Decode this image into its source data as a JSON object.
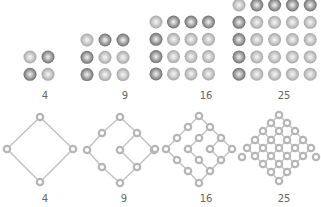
{
  "colors": {
    "sphere_dark_edge": "#6e6e6e",
    "sphere_dark_mid": "#9a9a9a",
    "sphere_light_edge": "#a9a9a9",
    "sphere_light_mid": "#cfcfcf",
    "sphere_highlight": "#f4f4f4",
    "edge": "#bdbdbd",
    "node": "#b5b5b5",
    "label": "#666666"
  },
  "sphere_grids": [
    {
      "label": "4",
      "label_x": 45,
      "label_y": 99,
      "x0": 30,
      "y0": 57,
      "step_x": 18,
      "step_y": 17.3,
      "r": 6.5,
      "pattern": [
        "LD",
        "DL"
      ]
    },
    {
      "label": "9",
      "label_x": 125,
      "label_y": 99,
      "x0": 87,
      "y0": 40,
      "step_x": 18,
      "step_y": 17.3,
      "r": 6.5,
      "pattern": [
        "LDD",
        "DLL",
        "DLL"
      ]
    },
    {
      "label": "16",
      "label_x": 206,
      "label_y": 99,
      "x0": 156,
      "y0": 22,
      "step_x": 17.5,
      "step_y": 17.3,
      "r": 6.5,
      "pattern": [
        "LDDD",
        "DLLL",
        "DLLL",
        "DLLL"
      ]
    },
    {
      "label": "25",
      "label_x": 284,
      "label_y": 99,
      "x0": 239,
      "y0": 5,
      "step_x": 17.8,
      "step_y": 17.3,
      "r": 6.5,
      "pattern": [
        "LDDDD",
        "DLLLL",
        "DLLLL",
        "DLLLL",
        "DLLLL"
      ]
    }
  ],
  "lattices": [
    {
      "label": "4",
      "label_x": 45,
      "label_y": 202,
      "nodes": [
        [
          40,
          117
        ],
        [
          7,
          149
        ],
        [
          73,
          149
        ],
        [
          40,
          182
        ]
      ],
      "edges": [
        [
          0,
          1
        ],
        [
          0,
          2
        ],
        [
          1,
          3
        ],
        [
          2,
          3
        ]
      ]
    },
    {
      "label": "9",
      "label_x": 124,
      "label_y": 202,
      "nodes": [
        [
          120,
          117
        ],
        [
          102,
          133
        ],
        [
          137,
          133
        ],
        [
          87,
          150
        ],
        [
          120,
          150
        ],
        [
          154,
          150
        ],
        [
          102,
          167
        ],
        [
          137,
          167
        ],
        [
          120,
          183
        ]
      ],
      "edges": [
        [
          0,
          1
        ],
        [
          0,
          2
        ],
        [
          1,
          3
        ],
        [
          3,
          6
        ],
        [
          6,
          8
        ],
        [
          2,
          4
        ],
        [
          2,
          5
        ],
        [
          4,
          7
        ],
        [
          5,
          7
        ],
        [
          7,
          8
        ]
      ]
    },
    {
      "label": "16",
      "label_x": 206,
      "label_y": 202,
      "nodes": [
        [
          199,
          116
        ],
        [
          188,
          127
        ],
        [
          210,
          127
        ],
        [
          177,
          138
        ],
        [
          199,
          138
        ],
        [
          221,
          138
        ],
        [
          166,
          149
        ],
        [
          188,
          149
        ],
        [
          210,
          149
        ],
        [
          232,
          149
        ],
        [
          177,
          160
        ],
        [
          199,
          160
        ],
        [
          221,
          160
        ],
        [
          188,
          171
        ],
        [
          210,
          171
        ],
        [
          199,
          183
        ],
        [
          155,
          149
        ]
      ],
      "edges": [
        [
          0,
          1
        ],
        [
          0,
          2
        ],
        [
          1,
          3
        ],
        [
          3,
          6
        ],
        [
          6,
          10
        ],
        [
          10,
          13
        ],
        [
          13,
          15
        ],
        [
          2,
          4
        ],
        [
          2,
          5
        ],
        [
          4,
          7
        ],
        [
          7,
          11
        ],
        [
          11,
          14
        ],
        [
          14,
          15
        ],
        [
          5,
          8
        ],
        [
          5,
          9
        ],
        [
          8,
          12
        ],
        [
          9,
          12
        ],
        [
          12,
          14
        ]
      ]
    },
    {
      "label": "25",
      "label_x": 284,
      "label_y": 202,
      "nodes": [
        [
          279,
          115
        ],
        [
          271,
          123
        ],
        [
          287,
          123
        ],
        [
          263,
          131
        ],
        [
          279,
          131
        ],
        [
          295,
          131
        ],
        [
          255,
          140
        ],
        [
          271,
          140
        ],
        [
          287,
          140
        ],
        [
          303,
          140
        ],
        [
          247,
          148
        ],
        [
          263,
          148
        ],
        [
          279,
          148
        ],
        [
          295,
          148
        ],
        [
          311,
          148
        ],
        [
          255,
          156
        ],
        [
          271,
          156
        ],
        [
          287,
          156
        ],
        [
          303,
          156
        ],
        [
          263,
          164
        ],
        [
          279,
          164
        ],
        [
          295,
          164
        ],
        [
          271,
          172
        ],
        [
          287,
          172
        ],
        [
          279,
          181
        ],
        [
          242,
          157
        ],
        [
          316,
          157
        ]
      ],
      "edges": [
        [
          0,
          1
        ],
        [
          0,
          2
        ],
        [
          1,
          3
        ],
        [
          1,
          4
        ],
        [
          2,
          4
        ],
        [
          2,
          5
        ],
        [
          3,
          6
        ],
        [
          3,
          7
        ],
        [
          4,
          7
        ],
        [
          4,
          8
        ],
        [
          5,
          8
        ],
        [
          5,
          9
        ],
        [
          6,
          10
        ],
        [
          6,
          11
        ],
        [
          7,
          11
        ],
        [
          7,
          12
        ],
        [
          8,
          12
        ],
        [
          8,
          13
        ],
        [
          9,
          13
        ],
        [
          9,
          14
        ],
        [
          10,
          15
        ],
        [
          11,
          15
        ],
        [
          11,
          16
        ],
        [
          12,
          16
        ],
        [
          12,
          17
        ],
        [
          13,
          17
        ],
        [
          13,
          18
        ],
        [
          14,
          18
        ],
        [
          15,
          19
        ],
        [
          16,
          19
        ],
        [
          16,
          20
        ],
        [
          17,
          20
        ],
        [
          17,
          21
        ],
        [
          18,
          21
        ],
        [
          19,
          22
        ],
        [
          20,
          22
        ],
        [
          20,
          23
        ],
        [
          21,
          23
        ],
        [
          22,
          24
        ],
        [
          23,
          24
        ]
      ]
    }
  ]
}
